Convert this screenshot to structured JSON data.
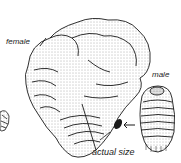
{
  "figure": {
    "labels": {
      "female": "female",
      "male": "male",
      "actual_size": "actual size"
    },
    "subjects": [
      "female scale insect",
      "male scale insect",
      "actual size specimen",
      "partial specimen at left edge"
    ],
    "colors": {
      "ink": "#1a1a1a",
      "background": "#ffffff",
      "stipple": "#555555"
    }
  }
}
